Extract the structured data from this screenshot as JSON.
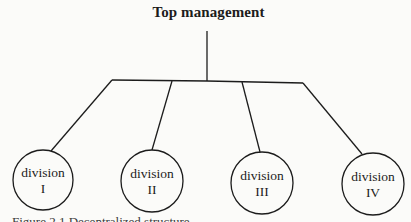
{
  "diagram": {
    "type": "org-chart",
    "root": {
      "label": "Top management"
    },
    "children": [
      {
        "label_line1": "division",
        "label_line2": "I"
      },
      {
        "label_line1": "division",
        "label_line2": "II"
      },
      {
        "label_line1": "division",
        "label_line2": "III"
      },
      {
        "label_line1": "division",
        "label_line2": "IV"
      }
    ],
    "caption": "Figure 2.1 Decentralized structure"
  }
}
